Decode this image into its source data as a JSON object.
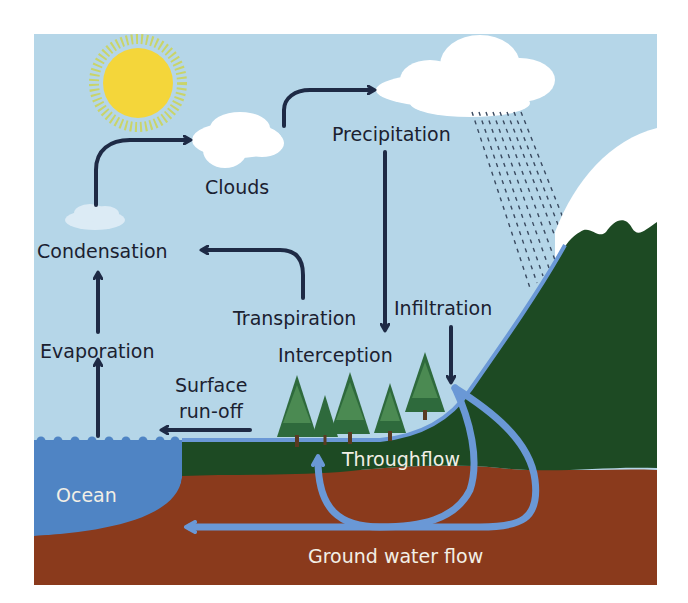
{
  "diagram": {
    "colors": {
      "sky": "#b5d6e8",
      "ocean": "#4f84c4",
      "soil": "#8a3a1c",
      "land": "#1d4a23",
      "snow": "#ffffff",
      "sun": "#f4d63a",
      "sun_rays": "#c9d46a",
      "arrow": "#1e2a45",
      "water_flow": "#6a98d6",
      "rain": "#3a4a60"
    },
    "labels": {
      "clouds": "Clouds",
      "precipitation": "Precipitation",
      "condensation": "Condensation",
      "transpiration": "Transpiration",
      "infiltration": "Infiltration",
      "evaporation": "Evaporation",
      "interception": "Interception",
      "surface_runoff_line1": "Surface",
      "surface_runoff_line2": "run-off",
      "ocean": "Ocean",
      "throughflow": "Throughflow",
      "ground_water_flow": "Ground water flow"
    },
    "icons": [
      "sun-icon",
      "cloud-icon",
      "rain-icon",
      "tree-icon",
      "mountain-icon"
    ]
  }
}
